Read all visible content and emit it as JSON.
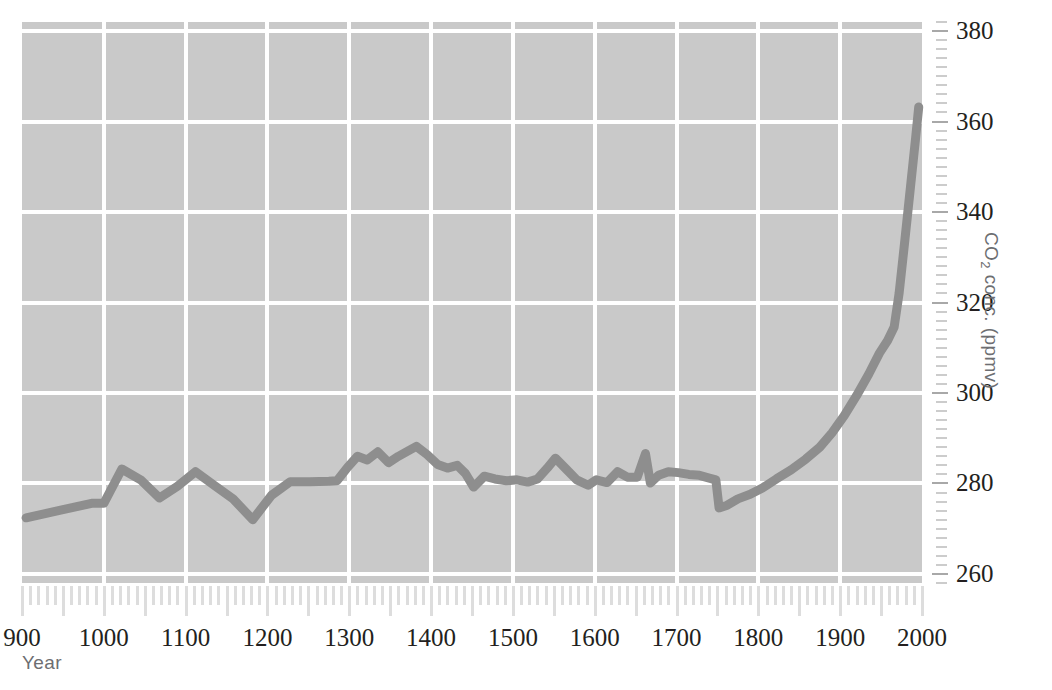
{
  "chart_data": {
    "type": "line",
    "title": "",
    "xlabel": "Year",
    "ylabel": "CO2 conc. (ppmv)",
    "ylabel_parts": {
      "pre": "CO",
      "sub": "2",
      "post": " conc. (ppmv)"
    },
    "xlim": [
      900,
      2000
    ],
    "ylim": [
      258,
      382
    ],
    "grid": true,
    "grid_x_step": 100,
    "grid_y_step": 20,
    "legend": "none",
    "x_ticks": [
      900,
      1000,
      1100,
      1200,
      1300,
      1400,
      1500,
      1600,
      1700,
      1800,
      1900,
      2000
    ],
    "x_tick_labels": [
      "900",
      "1000",
      "1100",
      "1200",
      "1300",
      "1400",
      "1500",
      "1600",
      "1700",
      "1800",
      "1900",
      "2000"
    ],
    "x_minor_tick_step": 10,
    "x_major_tick_step": 50,
    "y_ticks": [
      260,
      280,
      300,
      320,
      340,
      360,
      380
    ],
    "y_tick_labels": [
      "260",
      "280",
      "300",
      "320",
      "340",
      "360",
      "380"
    ],
    "y_minor_tick_step": 2,
    "series": [
      {
        "name": "CO2 concentration",
        "color": "#8e8e8e",
        "line_width": 9,
        "x": [
          905,
          950,
          985,
          1000,
          1022,
          1045,
          1068,
          1090,
          1112,
          1135,
          1158,
          1182,
          1205,
          1228,
          1252,
          1275,
          1285,
          1298,
          1310,
          1322,
          1335,
          1348,
          1360,
          1372,
          1382,
          1395,
          1408,
          1420,
          1432,
          1442,
          1452,
          1465,
          1478,
          1492,
          1505,
          1518,
          1530,
          1542,
          1552,
          1565,
          1578,
          1592,
          1602,
          1615,
          1628,
          1640,
          1652,
          1662,
          1668,
          1678,
          1690,
          1702,
          1715,
          1728,
          1740,
          1748,
          1752,
          1762,
          1775,
          1790,
          1805,
          1822,
          1840,
          1858,
          1875,
          1890,
          1905,
          1920,
          1935,
          1948,
          1958,
          1966,
          1972,
          1978,
          1985,
          1992,
          1996
        ],
        "y": [
          272.4,
          274.2,
          275.6,
          275.6,
          283.2,
          280.8,
          276.8,
          279.4,
          282.6,
          279.6,
          276.6,
          272.0,
          277.4,
          280.4,
          280.4,
          280.5,
          280.6,
          283.6,
          286.0,
          285.2,
          287.0,
          284.6,
          286.0,
          287.2,
          288.2,
          286.4,
          284.2,
          283.4,
          284.0,
          282.2,
          279.2,
          281.6,
          281.0,
          280.6,
          280.8,
          280.3,
          281.0,
          283.4,
          285.6,
          283.2,
          280.8,
          279.6,
          280.8,
          280.2,
          282.6,
          281.4,
          281.4,
          286.6,
          280.1,
          281.8,
          282.6,
          282.4,
          282.0,
          281.8,
          281.2,
          280.8,
          274.6,
          275.2,
          276.6,
          277.6,
          279.0,
          281.0,
          283.0,
          285.4,
          288.0,
          291.2,
          295.0,
          299.4,
          304.2,
          308.8,
          311.6,
          314.6,
          322.0,
          332.0,
          344.0,
          356.0,
          363.2
        ]
      }
    ],
    "colors": {
      "panel_background": "#c9c9c9",
      "gridline": "#ffffff",
      "series_line": "#8e8e8e",
      "tick_label": "#231f20",
      "axis_title": "#6d6e71",
      "minor_tick": "#dddddd",
      "page_background": "#ffffff"
    }
  }
}
